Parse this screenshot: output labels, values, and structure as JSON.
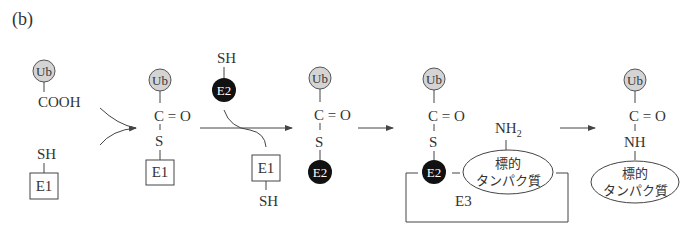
{
  "panel_label": "(b)",
  "molecules": {
    "ub": "Ub",
    "cooh": "COOH",
    "sh": "SH",
    "e1": "E1",
    "e2": "E2",
    "e3": "E3",
    "c_eq_o": "C = O",
    "s": "S",
    "nh": "NH",
    "nh2_main": "NH",
    "nh2_sub": "2",
    "target_line1": "標的",
    "target_line2": "タンパク質"
  },
  "colors": {
    "ub_fill": "#d4d4d4",
    "e2_fill": "#111111",
    "line": "#444444"
  },
  "steps": [
    {
      "id": "step1",
      "label": "Ub-COOH + E1-SH"
    },
    {
      "id": "step2",
      "label": "Ub-C(=O)-S-E1"
    },
    {
      "id": "step3",
      "label": "Ub-C(=O)-S-E2"
    },
    {
      "id": "step4",
      "label": "E2/E3 with target protein"
    },
    {
      "id": "step5",
      "label": "Ub-C(=O)-NH-target protein"
    }
  ]
}
